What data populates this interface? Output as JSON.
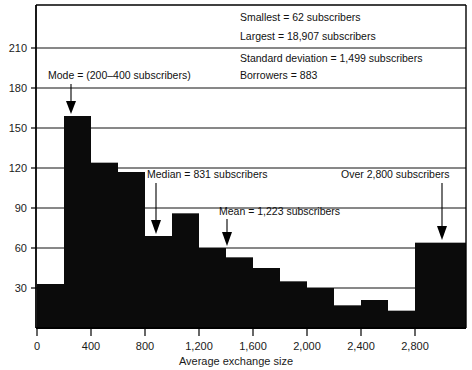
{
  "chart_data": {
    "type": "bar",
    "title": "",
    "subtitle": "",
    "xlabel": "Average exchange size",
    "ylabel": "",
    "xlim": [
      0,
      3000
    ],
    "ylim": [
      0,
      225
    ],
    "grid": true,
    "legend_position": "none",
    "bin_width": 200,
    "x_tick_labels": [
      "0",
      "400",
      "800",
      "1,200",
      "1,600",
      "2,000",
      "2,400",
      "2,800"
    ],
    "x_tick_values": [
      0,
      400,
      800,
      1200,
      1600,
      2000,
      2400,
      2800
    ],
    "y_tick_labels": [
      "30",
      "60",
      "90",
      "120",
      "150",
      "180",
      "210"
    ],
    "y_tick_values": [
      30,
      60,
      90,
      120,
      150,
      180,
      210
    ],
    "categories": [
      "0-200",
      "200-400",
      "400-600",
      "600-800",
      "800-1000",
      "1000-1200",
      "1200-1400",
      "1400-1600",
      "1600-1800",
      "1800-2000",
      "2000-2200",
      "2200-2400",
      "2400-2600",
      "2600-2800",
      "2800+"
    ],
    "bin_starts": [
      0,
      200,
      400,
      600,
      800,
      1000,
      1200,
      1400,
      1600,
      1800,
      2000,
      2200,
      2400,
      2600,
      2800
    ],
    "values": [
      33,
      159,
      124,
      117,
      69,
      86,
      60,
      53,
      45,
      35,
      30,
      17,
      21,
      13,
      64
    ],
    "annotations": [
      {
        "id": "mode",
        "text": "Mode = (200–400 subscribers)",
        "x_value": 300,
        "y_value": 159
      },
      {
        "id": "median",
        "text": "Median = 831 subscribers",
        "x_value": 831,
        "y_value": 69
      },
      {
        "id": "mean",
        "text": "Mean = 1,223 subscribers",
        "x_value": 1223,
        "y_value": 60
      },
      {
        "id": "overflow",
        "text": "Over 2,800 subscribers",
        "x_value": 2900,
        "y_value": 64
      }
    ],
    "stats_box": {
      "group_one": [
        "Smallest = 62 subscribers",
        "Largest = 18,907 subscribers"
      ],
      "group_two": [
        "Standard deviation = 1,499 subscribers",
        "Borrowers = 883"
      ]
    }
  },
  "stats": {
    "smallest": "Smallest = 62 subscribers",
    "largest": "Largest = 18,907 subscribers",
    "std_dev": "Standard deviation = 1,499 subscribers",
    "borrowers": "Borrowers = 883"
  },
  "labels": {
    "mode": "Mode = (200–400 subscribers)",
    "median": "Median = 831 subscribers",
    "mean": "Mean = 1,223 subscribers",
    "overflow": "Over 2,800 subscribers",
    "x_axis_title": "Average exchange size"
  },
  "ticks": {
    "y": [
      "210",
      "180",
      "150",
      "120",
      "90",
      "60",
      "30"
    ],
    "x": [
      "0",
      "400",
      "800",
      "1,200",
      "1,600",
      "2,000",
      "2,400",
      "2,800"
    ]
  },
  "colors": {
    "bar": "#0b0b0b",
    "axis": "#000000",
    "text": "#111111",
    "background": "#ffffff"
  }
}
